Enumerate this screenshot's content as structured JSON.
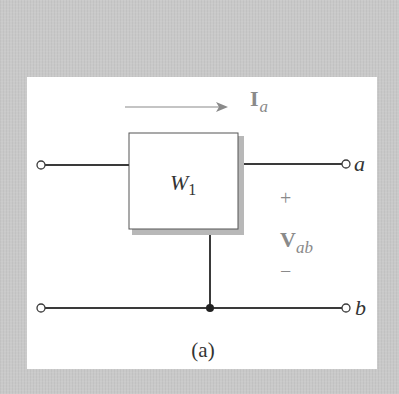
{
  "figure": {
    "caption": "(a)",
    "block_label": "W",
    "block_subscript": "1",
    "current_label": "I",
    "current_subscript": "a",
    "terminal_top_label": "a",
    "terminal_bottom_label": "b",
    "voltage_label": "V",
    "voltage_subscript": "ab",
    "voltage_plus": "+",
    "voltage_minus": "−"
  },
  "colors": {
    "background": "#c9c9c9",
    "panel": "#ffffff",
    "wire": "#3a3a3a",
    "annotation": "#7a7a7a",
    "box_shadow": "#b8b8b8"
  }
}
